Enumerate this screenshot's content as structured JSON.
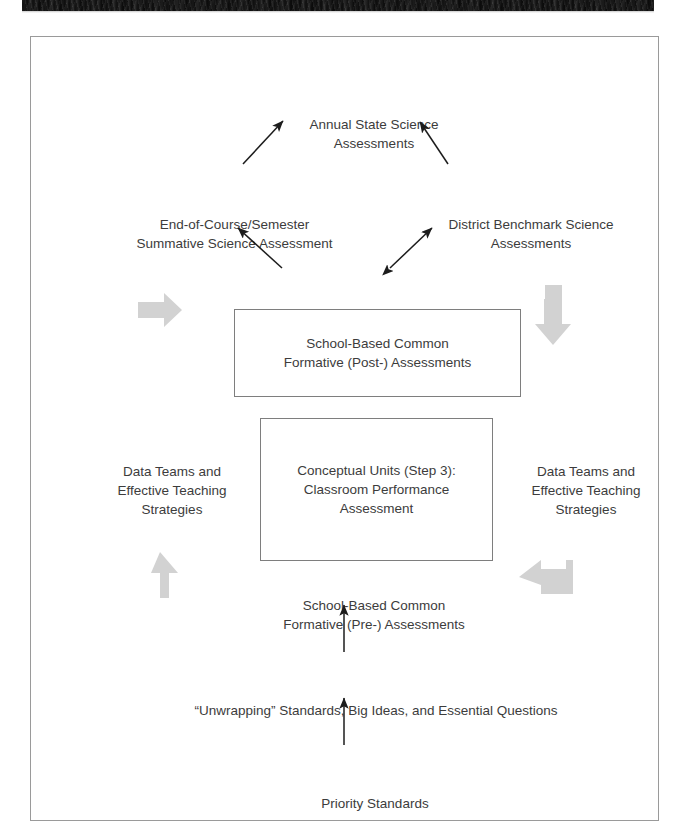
{
  "page": {
    "header_band_text": "",
    "figure_caption": ""
  },
  "diagram": {
    "nodes": {
      "annual_state": "Annual State Science\nAssessments",
      "end_of_course": "End-of-Course/Semester\nSummative Science Assessment",
      "district_benchmark": "District Benchmark Science\nAssessments",
      "post_assessment": "School-Based Common\nFormative (Post-) Assessments",
      "conceptual_units": "Conceptual Units (Step 3):\nClassroom Performance\nAssessment",
      "data_teams_left": "Data Teams and\nEffective Teaching\nStrategies",
      "data_teams_right": "Data Teams and\nEffective Teaching\nStrategies",
      "pre_assessment": "School-Based Common\nFormative (Pre-) Assessments",
      "unwrapping": "“Unwrapping” Standards, Big Ideas, and Essential Questions",
      "priority_standards": "Priority Standards"
    },
    "colors": {
      "text": "#3c3c3c",
      "box_border": "#7e7e7e",
      "frame_border": "#9a9a9a",
      "thin_arrow": "#1c1c1c",
      "cycle_arrow": "#d2d2d2",
      "header_band": "#121212"
    },
    "cycle_arrows": [
      {
        "name": "cycle-arrow-left-upper",
        "direction": "right"
      },
      {
        "name": "cycle-arrow-right-upper",
        "direction": "down"
      },
      {
        "name": "cycle-arrow-left-lower",
        "direction": "up"
      },
      {
        "name": "cycle-arrow-right-lower",
        "direction": "left"
      }
    ],
    "connector_arrows": [
      {
        "name": "arrow-post-to-end-of-course",
        "heads": 1
      },
      {
        "name": "arrow-post-to-district-benchmark",
        "heads": 2
      },
      {
        "name": "arrow-end-of-course-to-annual",
        "heads": 1
      },
      {
        "name": "arrow-district-to-annual",
        "heads": 1
      },
      {
        "name": "arrow-unwrapping-to-pre",
        "heads": 1
      },
      {
        "name": "arrow-priority-to-unwrapping",
        "heads": 1
      }
    ]
  }
}
